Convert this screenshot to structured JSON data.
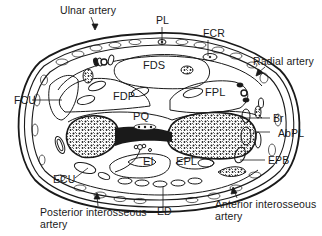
{
  "diagram": {
    "type": "anatomical cross-section",
    "colors": {
      "ink": "#1a1a1a",
      "background": "#ffffff",
      "bone_fill": "#ffffff"
    },
    "labels": {
      "ulnar_artery": "Ulnar artery",
      "pl": "PL",
      "fcr": "FCR",
      "radial_artery": "Radial artery",
      "fds": "FDS",
      "fcu": "FCU",
      "fdp": "FDP",
      "fpl": "FPL",
      "pq": "PQ",
      "br": "Br",
      "abpl": "AbPL",
      "epb": "EPB",
      "ecu": "ECU",
      "ei": "EI",
      "epl": "EPL",
      "ed": "ED",
      "posterior_interosseous_line1": "Posterior interosseous",
      "posterior_interosseous_line2": "artery",
      "anterior_interosseous_line1": "Anterior interosseous",
      "anterior_interosseous_line2": "artery"
    }
  }
}
